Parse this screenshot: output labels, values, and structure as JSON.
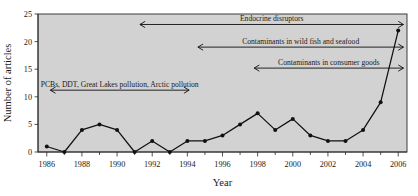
{
  "chart_data": {
    "type": "line",
    "title": "",
    "xlabel": "Year",
    "ylabel": "Number of articles",
    "xlim": [
      1985.5,
      2006.5
    ],
    "ylim": [
      0,
      25
    ],
    "grid": false,
    "legend": "none",
    "x": [
      1986,
      1987,
      1988,
      1989,
      1990,
      1991,
      1992,
      1993,
      1994,
      1995,
      1996,
      1997,
      1998,
      1999,
      2000,
      2001,
      2002,
      2003,
      2004,
      2005,
      2006
    ],
    "values": [
      1,
      0,
      4,
      5,
      4,
      0,
      2,
      0,
      2,
      2,
      3,
      5,
      7,
      4,
      6,
      3,
      2,
      2,
      4,
      9,
      22
    ],
    "series": [
      {
        "name": "Number of articles",
        "values": [
          1,
          0,
          4,
          5,
          4,
          0,
          2,
          0,
          2,
          2,
          3,
          5,
          7,
          4,
          6,
          3,
          2,
          2,
          4,
          9,
          22
        ]
      }
    ],
    "x_tick_labels": [
      "1986",
      "1988",
      "1990",
      "1992",
      "1994",
      "1996",
      "1998",
      "2000",
      "2002",
      "2004",
      "2006"
    ],
    "x_tick_values": [
      1986,
      1988,
      1990,
      1992,
      1994,
      1996,
      1998,
      2000,
      2002,
      2004,
      2006
    ],
    "x_minor_ticks": [
      1987,
      1989,
      1991,
      1993,
      1995,
      1997,
      1999,
      2001,
      2003,
      2005
    ],
    "y_tick_labels": [
      "0",
      "5",
      "10",
      "15",
      "20",
      "25"
    ],
    "y_tick_values": [
      0,
      5,
      10,
      15,
      20,
      25
    ],
    "annotations": [
      {
        "text": "Endocrine disruptors",
        "y_value": 23.1,
        "x_start": 1991.3,
        "x_end": 2006.3,
        "arrow": "double"
      },
      {
        "text": "Contaminants in wild fish and seafood",
        "y_value": 19.0,
        "x_start": 1994.6,
        "x_end": 2006.3,
        "arrow": "double"
      },
      {
        "text": "Contaminants in consumer goods",
        "y_value": 15.2,
        "x_start": 1997.8,
        "x_end": 2006.3,
        "arrow": "double"
      },
      {
        "text": "PCBs, DDT, Great Lakes pollution, Arctic pollution",
        "y_value": 11.2,
        "x_start": 1986.2,
        "x_end": 1994.1,
        "arrow": "double"
      }
    ],
    "colors": {
      "plot_background": "#d2d2d2",
      "page_background": "#ffffff",
      "line": "#111111",
      "marker": "#111111",
      "axis": "#2a2a2a",
      "text": "#1a1a1a"
    }
  }
}
